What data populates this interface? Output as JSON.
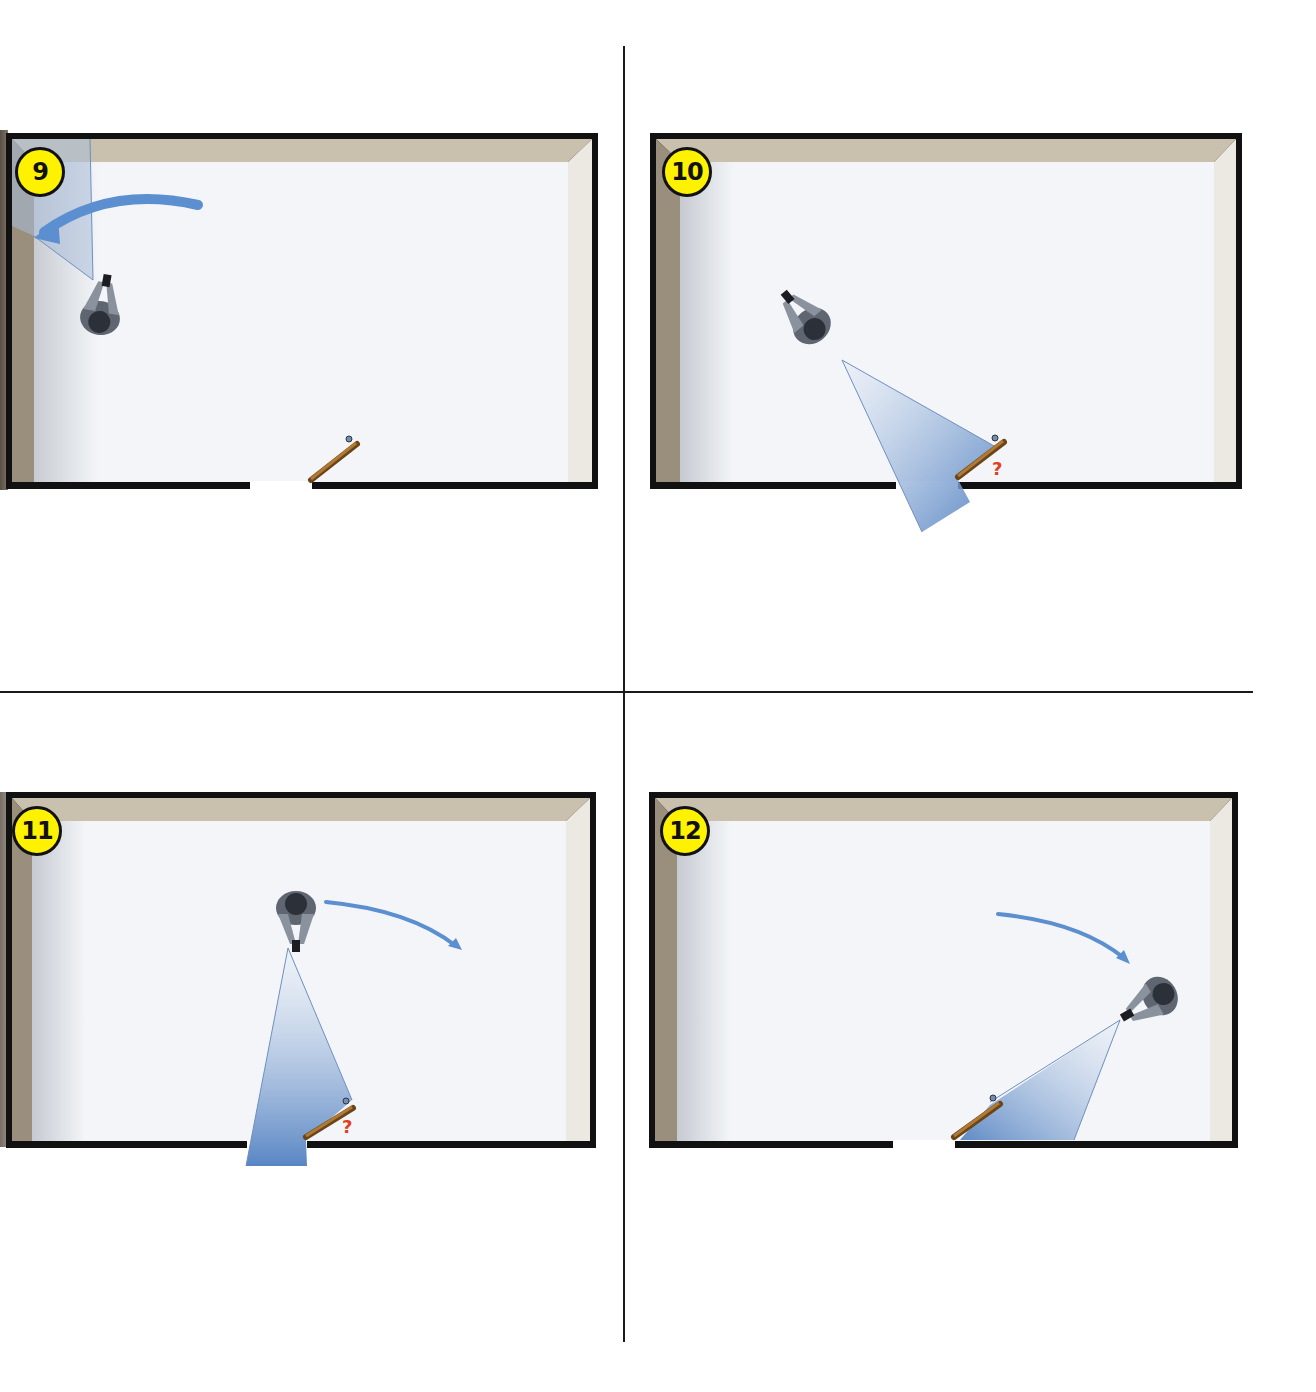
{
  "figure": {
    "type": "tactical-room-clearing-sequence",
    "panels": [
      {
        "step": "9",
        "position": "top-left",
        "description": "Officer scans toward upper-left corner; arrow indicates sweep toward corner",
        "door_state": "ajar",
        "question_mark": ""
      },
      {
        "step": "10",
        "position": "top-right",
        "description": "Officer turns and lights toward partially open door",
        "door_state": "ajar",
        "question_mark": "?"
      },
      {
        "step": "11",
        "position": "bottom-left",
        "description": "Officer moves to top center, light aimed at door; arrow shows movement to the right",
        "door_state": "ajar",
        "question_mark": "?"
      },
      {
        "step": "12",
        "position": "bottom-right",
        "description": "Officer repositions to right side, light aimed back toward door",
        "door_state": "ajar",
        "question_mark": ""
      }
    ]
  },
  "colors": {
    "badge_fill": "#fff200",
    "badge_border": "#111111",
    "wall_outer": "#111111",
    "wall_top": "#c9c0ae",
    "wall_left": "#9a8f7c",
    "wall_right": "#ece9e2",
    "floor": "#f3f5f8",
    "light_cone": "#5a86c4",
    "arrow": "#5b8fd0",
    "door": "#8a5a22",
    "question_mark": "#e0401c"
  }
}
